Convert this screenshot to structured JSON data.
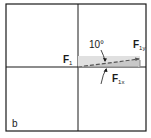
{
  "figure": {
    "panel_label": "b",
    "labels": {
      "force": "F",
      "force_sub": "1",
      "angle": "10°",
      "x_component": "F",
      "x_component_sub": "1x",
      "y_component": "F",
      "y_component_sub": "1y"
    },
    "colors": {
      "line": "#1a1a1a",
      "shade": "#d9d9d9",
      "dashed": "#555555"
    }
  }
}
